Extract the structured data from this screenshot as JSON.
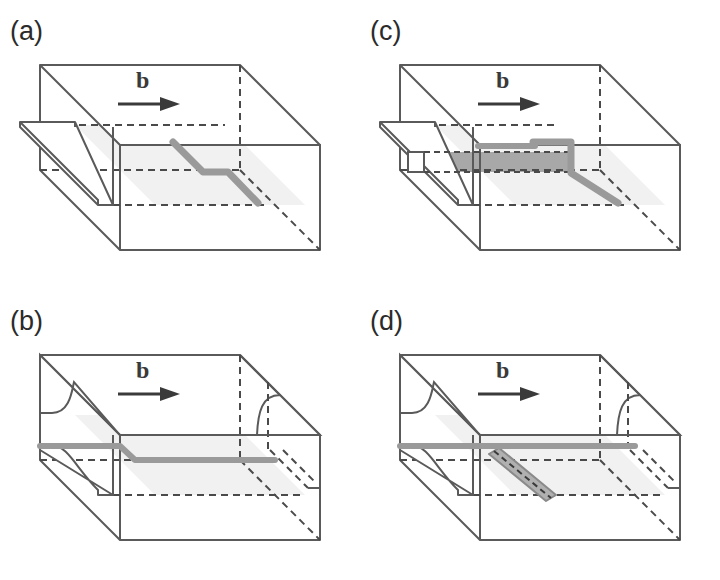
{
  "figure": {
    "background_color": "#ffffff",
    "panel_count": 4
  },
  "style": {
    "solid_edge_color": "#5a5a5a",
    "hidden_edge_color": "#4a4a4a",
    "dislocation_color": "#9a9a9a",
    "dislocation_edge_color": "#8a8a8a",
    "slip_plane_fill": "#f1f1f1",
    "band_fill": "#a8a8a8",
    "dipole_fill": "#b0b0b0",
    "step_face_fill": "#ffffff",
    "label_color": "#2b2b2b",
    "burgers_color": "#3a3a3a"
  },
  "panels": [
    {
      "id": "a",
      "label": "(a)",
      "burgers_label": "b",
      "burgers_arrow": "arrow-right",
      "description": "Crystal block with a jogged dislocation line lying on the slip plane; a surface step is present on the left face only.",
      "features": [
        "crystal-block",
        "slip-plane",
        "jogged-dislocation-line",
        "left-surface-step",
        "burgers-vector-arrow"
      ],
      "dislocation_shape": "diagonal-jog-diagonal",
      "has_left_step": true,
      "has_right_step": false,
      "has_dark_band": false,
      "has_dipole": false
    },
    {
      "id": "b",
      "label": "(b)",
      "burgers_label": "b",
      "burgers_arrow": "arrow-right",
      "description": "Dislocation has glided across the crystal producing surface steps on both the left and right faces; the line retains a small jog.",
      "features": [
        "crystal-block",
        "slip-plane",
        "jogged-dislocation-line",
        "left-surface-step",
        "right-surface-step",
        "burgers-vector-arrow"
      ],
      "dislocation_shape": "horizontal-with-small-jog",
      "has_left_step": true,
      "has_right_step": true,
      "has_dark_band": false,
      "has_dipole": false
    },
    {
      "id": "c",
      "label": "(c)",
      "burgers_label": "b",
      "burgers_arrow": "arrow-right",
      "description": "Same configuration as (a) but with a dark band of swept area trailing behind the jog on the slip plane.",
      "features": [
        "crystal-block",
        "slip-plane",
        "jogged-dislocation-line",
        "left-surface-step",
        "dark-swept-band",
        "burgers-vector-arrow"
      ],
      "dislocation_shape": "diagonal-jog-diagonal",
      "has_left_step": true,
      "has_right_step": false,
      "has_dark_band": true,
      "has_dipole": false
    },
    {
      "id": "d",
      "label": "(d)",
      "burgers_label": "b",
      "burgers_arrow": "arrow-right",
      "description": "Dislocation has glided through leaving steps on both faces and a trailing dislocation dipole drawn as a diagonal shaded strip.",
      "features": [
        "crystal-block",
        "slip-plane",
        "dislocation-line",
        "left-surface-step",
        "right-surface-step",
        "dislocation-dipole",
        "burgers-vector-arrow"
      ],
      "dislocation_shape": "horizontal-with-diagonal-dipole",
      "has_left_step": true,
      "has_right_step": true,
      "has_dark_band": false,
      "has_dipole": true
    }
  ]
}
